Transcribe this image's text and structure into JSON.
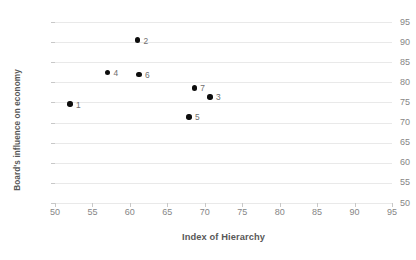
{
  "chart_data": {
    "type": "scatter",
    "title": "",
    "xlabel": "Index of Hierarchy",
    "ylabel": "Board's influence on economy",
    "xlim": [
      50,
      95
    ],
    "ylim": [
      50,
      95
    ],
    "xticks": [
      50,
      55,
      60,
      65,
      70,
      75,
      80,
      85,
      90,
      95
    ],
    "yticks": [
      50,
      55,
      60,
      65,
      70,
      75,
      80,
      85,
      90,
      95
    ],
    "grid": "horizontal",
    "legend": "none",
    "marker_color": "#0d0d0d",
    "gridline_color": "#e9e9e9",
    "axis_color": "#c8c8c8",
    "tick_label_color": "#868686",
    "axis_title_color": "#585858",
    "points": [
      {
        "label": "1",
        "x": 52.0,
        "y": 74.6
      },
      {
        "label": "2",
        "x": 61.0,
        "y": 90.5
      },
      {
        "label": "3",
        "x": 70.7,
        "y": 76.4
      },
      {
        "label": "4",
        "x": 57.0,
        "y": 82.4
      },
      {
        "label": "5",
        "x": 67.9,
        "y": 71.4
      },
      {
        "label": "6",
        "x": 61.2,
        "y": 82.0
      },
      {
        "label": "7",
        "x": 68.6,
        "y": 78.6
      }
    ]
  }
}
